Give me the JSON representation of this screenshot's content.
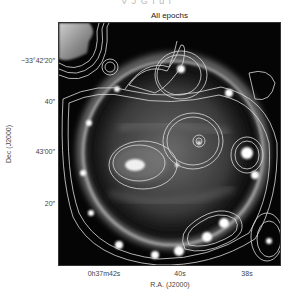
{
  "header": {
    "cut_text": "V J G I  d i"
  },
  "figure": {
    "panel_title": "All epochs",
    "x_axis": {
      "label": "R.A. (J2000)",
      "ticks": [
        {
          "label": "0h37m42s",
          "x": 104
        },
        {
          "label": "40s",
          "x": 180
        },
        {
          "label": "38s",
          "x": 247
        }
      ]
    },
    "y_axis": {
      "label": "Dec (J2000)",
      "ticks": [
        {
          "label": "−33°42′20″",
          "y": 57
        },
        {
          "label": "40″",
          "y": 98
        },
        {
          "label": "43′00″",
          "y": 148
        },
        {
          "label": "20″",
          "y": 200
        }
      ]
    },
    "colors": {
      "background": "#050505",
      "contour": "#d8d8d8",
      "ring": "#bfbfbf"
    }
  }
}
